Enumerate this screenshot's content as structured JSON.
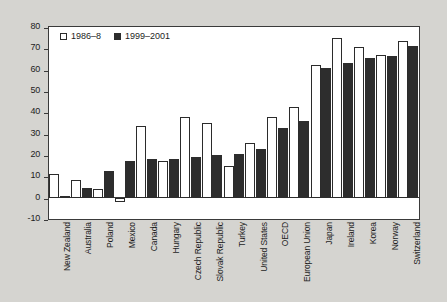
{
  "chart_data": {
    "type": "bar",
    "title": "",
    "xlabel": "",
    "ylabel": "",
    "ylim": [
      -10,
      80
    ],
    "ytick_step": 10,
    "yticks": [
      "80",
      "70",
      "60",
      "50",
      "40",
      "30",
      "20",
      "10",
      "0",
      "-10"
    ],
    "grid": false,
    "legend_position": "top-left",
    "categories": [
      "New Zealand",
      "Australia",
      "Poland",
      "Mexico",
      "Canada",
      "Hungary",
      "Czech Republic",
      "Slovak Republic",
      "Turkey",
      "United States",
      "OECD",
      "European Union",
      "Japan",
      "Ireland",
      "Korea",
      "Norway",
      "Switzerland"
    ],
    "series": [
      {
        "name": "1986–8",
        "color": "#ffffff",
        "values": [
          11,
          8.5,
          4,
          -2,
          33.5,
          17,
          38,
          35,
          14.7,
          25.5,
          38,
          42.5,
          62,
          75,
          70.5,
          66.8,
          73.5
        ]
      },
      {
        "name": "1999–2001",
        "color": "#2d2d2d",
        "values": [
          1,
          4.7,
          12.3,
          17.4,
          18,
          18.2,
          19,
          20,
          20.7,
          23,
          32.7,
          36,
          61,
          63.2,
          65.5,
          66.3,
          71
        ]
      }
    ]
  },
  "legend": {
    "items": [
      {
        "label": "1986–8",
        "swatch": "open-square-icon"
      },
      {
        "label": "1999–2001",
        "swatch": "filled-square-icon"
      }
    ]
  },
  "colors": {
    "figure_background": "#d5d4d0",
    "plot_background": "#ffffff",
    "axis": "#3a3a3a",
    "series_old": "#ffffff",
    "series_new": "#2d2d2d"
  }
}
